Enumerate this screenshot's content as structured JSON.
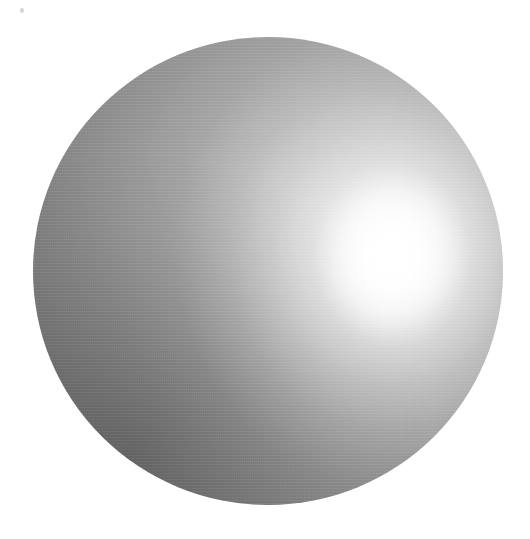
{
  "image": {
    "subject": "sphere",
    "description": "Glossy light-gray sphere lit from the upper right, photographed against a plain white background",
    "width_px": 530,
    "height_px": 539,
    "background_color": "#ffffff"
  },
  "sphere": {
    "name": "sphere",
    "center_x_px": 268,
    "center_y_px": 271,
    "diameter_px": 470,
    "bounds": {
      "left_px": 33,
      "top_px": 37,
      "right_px": 503,
      "bottom_px": 505
    },
    "material": "matte-to-glossy metallic gray",
    "base_color": "#8d8d8d",
    "midtone_color": "#999999",
    "shadow_color": "#545454",
    "rim_color": "#7a7a7a"
  },
  "highlight": {
    "name": "specular-highlight",
    "center_x_px": 392,
    "center_y_px": 255,
    "core_color": "#ffffff",
    "falloff_color": "#d9d9d9",
    "light_direction": "upper-right"
  },
  "shading": {
    "name": "diffuse-shading",
    "darkest_region": "lower-left",
    "darkest_color": "#4e4e4e",
    "lightest_region": "right-of-center",
    "lightest_color": "#ffffff",
    "top_color": "#787878",
    "left_color": "#838383",
    "bottom_right_color": "#6a6a6a"
  },
  "artifacts": {
    "speck": {
      "name": "dust-speck",
      "x_px": 22,
      "y_px": 10,
      "color": "#969696"
    },
    "grain": {
      "name": "film-grain",
      "present": true
    }
  }
}
